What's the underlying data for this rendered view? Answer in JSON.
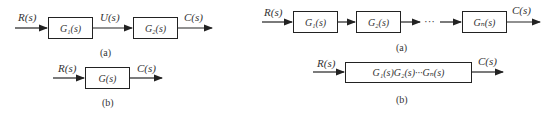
{
  "left": {
    "a": {
      "input_label": "R(s)",
      "block1": "G₁(s)",
      "mid_label": "U(s)",
      "block2": "G₂(s)",
      "output_label": "C(s)",
      "caption": "(a)"
    },
    "b": {
      "input_label": "R(s)",
      "block": "G(s)",
      "output_label": "C(s)",
      "caption": "(b)"
    }
  },
  "right": {
    "a": {
      "input_label": "R(s)",
      "block1": "G₁(s)",
      "block2": "G₂(s)",
      "ellipsis": "···",
      "blockn": "Gₙ(s)",
      "output_label": "C(s)",
      "caption": "(a)"
    },
    "b": {
      "input_label": "R(s)",
      "block": "G₁(s)G₂(s)···Gₙ(s)",
      "output_label": "C(s)",
      "caption": "(b)"
    }
  }
}
